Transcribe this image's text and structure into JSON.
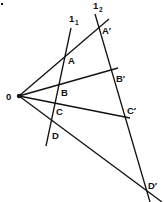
{
  "diagram": {
    "type": "geometry",
    "origin": {
      "label": "0",
      "x": 19,
      "y": 96
    },
    "lines": [
      {
        "name": "l1",
        "label": "1",
        "subscript": "1",
        "x1": 71,
        "y1": 28,
        "x2": 46,
        "y2": 146,
        "label_x": 69,
        "label_y": 22
      },
      {
        "name": "l2",
        "label": "1",
        "subscript": "2",
        "x1": 95,
        "y1": 14,
        "x2": 150,
        "y2": 202,
        "label_x": 93,
        "label_y": 9
      }
    ],
    "rays": [
      {
        "name": "ray-OA",
        "x2": 109,
        "y2": 19
      },
      {
        "name": "ray-OB",
        "x2": 118,
        "y2": 68
      },
      {
        "name": "ray-OC",
        "x2": 130,
        "y2": 118
      },
      {
        "name": "ray-OD",
        "x2": 162,
        "y2": 202
      }
    ],
    "points": [
      {
        "label": "A",
        "x": 65,
        "y": 56,
        "label_x": 68,
        "label_y": 64
      },
      {
        "label": "B",
        "x": 59,
        "y": 85,
        "label_x": 61,
        "label_y": 96
      },
      {
        "label": "C",
        "x": 55,
        "y": 103,
        "label_x": 56,
        "label_y": 115
      },
      {
        "label": "D",
        "x": 52,
        "y": 121,
        "label_x": 52,
        "label_y": 139
      },
      {
        "label": "A′",
        "x": 100,
        "y": 27,
        "label_x": 102,
        "label_y": 34
      },
      {
        "label": "B′",
        "x": 112,
        "y": 71,
        "label_x": 116,
        "label_y": 82
      },
      {
        "label": "C′",
        "x": 124,
        "y": 116,
        "label_x": 127,
        "label_y": 114
      },
      {
        "label": "D′",
        "x": 146,
        "y": 190,
        "label_x": 148,
        "label_y": 189
      }
    ],
    "corner_mark": {
      "x": 2,
      "y": 4
    },
    "colors": {
      "stroke": "#111111",
      "background": "#ffffff"
    }
  }
}
